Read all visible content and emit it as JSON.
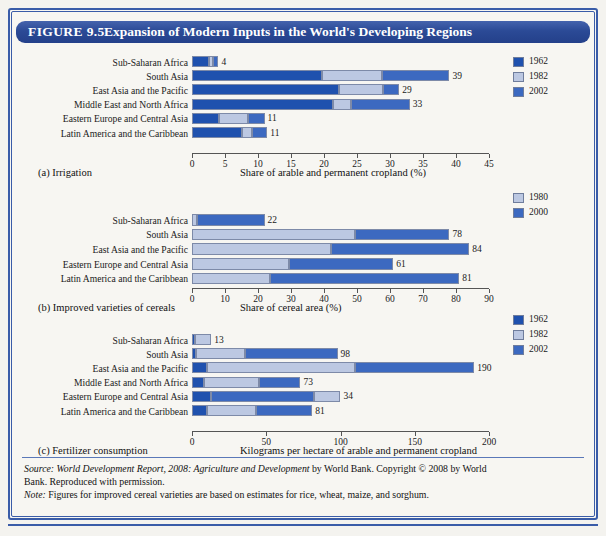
{
  "figure": {
    "number": "FIGURE 9.5",
    "title": "Expansion of Modern Inputs in the World's Developing Regions",
    "header_color": "#2b4a96",
    "frame_color": "#3a5ca8"
  },
  "colors": {
    "dark_blue_1962": "#1f51ae",
    "light_blue_1982": "#bcc8e2",
    "medium_blue_2002": "#3c69c0"
  },
  "source": {
    "line1_label": "Source:",
    "line1_italic": "World Development Report, 2008: Agriculture and Development",
    "line1_rest": " by World Bank. Copyright © 2008 by World",
    "line2": "Bank. Reproduced with permission.",
    "note_label": "Note:",
    "note_text": " Figures for improved cereal varieties are based on estimates for rice, wheat, maize, and sorghum."
  },
  "chart_data": [
    {
      "id": "a",
      "type": "bar",
      "orientation": "horizontal",
      "stacked": true,
      "title": "(a) Irrigation",
      "xlabel": "Share of arable and permanent cropland (%)",
      "ylabel": "",
      "xlim": [
        0,
        45
      ],
      "xticks": [
        0,
        5,
        10,
        15,
        20,
        25,
        30,
        35,
        40,
        45
      ],
      "grid": false,
      "legend_position": "top-right",
      "categories": [
        "Sub-Saharan Africa",
        "South Asia",
        "East Asia and the Pacific",
        "Middle East and North Africa",
        "Eastern Europe and Central Asia",
        "Latin America and the Caribbean"
      ],
      "series": [
        {
          "name": "1962",
          "color": "#1f51ae",
          "values": [
            2.5,
            19.7,
            22.3,
            21.3,
            4.1,
            7.6
          ]
        },
        {
          "name": "1982",
          "color": "#bcc8e2",
          "values": [
            0.7,
            9.1,
            6.6,
            2.8,
            4.4,
            1.5
          ]
        },
        {
          "name": "2002",
          "color": "#3c69c0",
          "values": [
            0.8,
            10.2,
            2.5,
            8.9,
            2.5,
            2.3
          ]
        }
      ],
      "totals": [
        4,
        39,
        29,
        33,
        11,
        11
      ],
      "value_labels": [
        "4",
        "39",
        "29",
        "33",
        "11",
        "11"
      ]
    },
    {
      "id": "b",
      "type": "bar",
      "orientation": "horizontal",
      "stacked": true,
      "title": "(b) Improved varieties of cereals",
      "xlabel": "Share of cereal area (%)",
      "ylabel": "",
      "xlim": [
        0,
        90
      ],
      "xticks": [
        0,
        10,
        20,
        30,
        40,
        50,
        60,
        70,
        80,
        90
      ],
      "grid": false,
      "legend_position": "top-right",
      "categories": [
        "Sub-Saharan Africa",
        "South Asia",
        "East Asia and the Pacific",
        "Eastern Europe and Central Asia",
        "Latin America and the Caribbean"
      ],
      "series": [
        {
          "name": "1980",
          "color": "#bcc8e2",
          "values": [
            1.5,
            49.5,
            42.0,
            29.5,
            23.5
          ]
        },
        {
          "name": "2000",
          "color": "#3c69c0",
          "values": [
            20.5,
            28.5,
            42.0,
            31.5,
            57.5
          ]
        }
      ],
      "totals": [
        22,
        78,
        84,
        61,
        81
      ],
      "value_labels": [
        "22",
        "78",
        "84",
        "61",
        "81"
      ]
    },
    {
      "id": "c",
      "type": "bar",
      "orientation": "horizontal",
      "stacked": true,
      "title": "(c) Fertilizer consumption",
      "xlabel": "Kilograms per hectare of arable and permanent cropland",
      "ylabel": "",
      "xlim": [
        0,
        200
      ],
      "xticks": [
        0,
        50,
        100,
        150,
        200
      ],
      "grid": false,
      "legend_position": "top-right",
      "categories": [
        "Sub-Saharan Africa",
        "South Asia",
        "East Asia and the Pacific",
        "Middle East and North Africa",
        "Eastern Europe and Central Asia",
        "Latin America and the Caribbean"
      ],
      "series": [
        {
          "name": "1962",
          "color": "#1f51ae",
          "values": [
            2,
            3,
            10,
            8,
            13,
            10
          ]
        },
        {
          "name": "1982",
          "color": "#bcc8e2",
          "values": [
            11,
            33,
            100,
            37,
            18,
            33
          ]
        },
        {
          "name": "2002",
          "color": "#3c69c0",
          "values": [
            0,
            62,
            80,
            28,
            69,
            38
          ]
        }
      ],
      "totals": [
        13,
        98,
        190,
        73,
        34,
        81
      ],
      "value_labels": [
        "13",
        "98",
        "190",
        "73",
        "34",
        "81"
      ],
      "note": "Eastern Europe and Central Asia: 2002 segment is drawn before the 1982 segment"
    }
  ],
  "legends": [
    {
      "chart": "a",
      "items": [
        {
          "label": "1962",
          "color": "#1f51ae"
        },
        {
          "label": "1982",
          "color": "#bcc8e2"
        },
        {
          "label": "2002",
          "color": "#3c69c0"
        }
      ]
    },
    {
      "chart": "b",
      "items": [
        {
          "label": "1980",
          "color": "#bcc8e2"
        },
        {
          "label": "2000",
          "color": "#3c69c0"
        }
      ]
    },
    {
      "chart": "c",
      "items": [
        {
          "label": "1962",
          "color": "#1f51ae"
        },
        {
          "label": "1982",
          "color": "#bcc8e2"
        },
        {
          "label": "2002",
          "color": "#3c69c0"
        }
      ]
    }
  ]
}
